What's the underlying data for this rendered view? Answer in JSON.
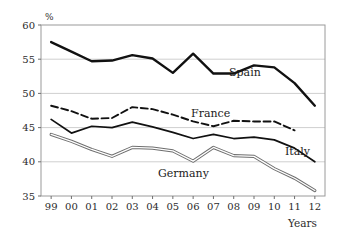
{
  "chart_data": {
    "type": "line",
    "title": "",
    "xlabel": "Years",
    "ylabel": "%",
    "ylim": [
      35,
      60
    ],
    "yticks": [
      35,
      40,
      45,
      50,
      55,
      60
    ],
    "grid": true,
    "legend": "inline-labels",
    "categories": [
      "99",
      "00",
      "01",
      "02",
      "03",
      "04",
      "05",
      "06",
      "07",
      "08",
      "09",
      "10",
      "11",
      "12"
    ],
    "series": [
      {
        "name": "Spain",
        "style": "solid-thick-black",
        "color": "#111111",
        "label_x": "07",
        "values": [
          57.5,
          56.1,
          54.7,
          54.8,
          55.6,
          55.1,
          53.0,
          55.8,
          52.9,
          52.9,
          54.1,
          53.8,
          51.5,
          48.2
        ]
      },
      {
        "name": "France",
        "style": "dashed-black",
        "color": "#111111",
        "label_x": "06",
        "values": [
          48.2,
          47.4,
          46.3,
          46.4,
          48.0,
          47.7,
          46.9,
          45.9,
          45.2,
          46.0,
          45.9,
          45.9,
          44.6,
          null
        ]
      },
      {
        "name": "Italy",
        "style": "solid-black",
        "color": "#111111",
        "label_x": "11",
        "values": [
          46.2,
          44.2,
          45.2,
          45.0,
          45.8,
          45.1,
          44.3,
          43.4,
          44.0,
          43.4,
          43.6,
          43.2,
          42.0,
          40.0
        ]
      },
      {
        "name": "Germany",
        "style": "double-line-gray",
        "color": "#8a8a8a",
        "label_x": "07",
        "values": [
          44.0,
          43.0,
          41.8,
          40.8,
          42.1,
          42.0,
          41.6,
          40.1,
          42.1,
          40.9,
          40.8,
          39.0,
          37.6,
          35.8
        ]
      }
    ]
  },
  "axes": {
    "y_unit_label": "%",
    "x_axis_title": "Years",
    "y_tick_labels": [
      "60",
      "55",
      "50",
      "45",
      "40",
      "35"
    ],
    "x_tick_labels": [
      "99",
      "00",
      "01",
      "02",
      "03",
      "04",
      "05",
      "06",
      "07",
      "08",
      "09",
      "10",
      "11",
      "12"
    ]
  },
  "series_labels": {
    "spain": "Spain",
    "france": "France",
    "italy": "Italy",
    "germany": "Germany"
  }
}
